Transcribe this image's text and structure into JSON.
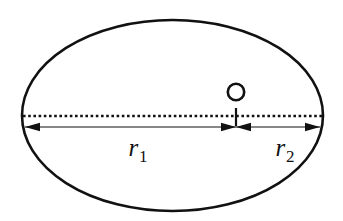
{
  "figure": {
    "name": "ellipse-radii-diagram",
    "background_color": "#ffffff",
    "stroke_color": "#111111",
    "canvas": {
      "width": 343,
      "height": 221
    }
  },
  "ellipse": {
    "center_x": 172.5,
    "center_y": 115.5,
    "radius_x": 150.5,
    "radius_y": 95.5,
    "stroke_width": 2.6,
    "fill": "none"
  },
  "axis_line": {
    "name": "major-axis-dotted",
    "y": 116,
    "x_start": 23,
    "x_end": 322,
    "style": "dotted",
    "dash_pattern": "2.6 2.6",
    "stroke_width": 2.4
  },
  "divider_tick": {
    "name": "center-tick",
    "x": 236,
    "y_top": 108,
    "y_bottom": 126,
    "stroke_width": 2.2
  },
  "circle_marker": {
    "name": "point-o-marker",
    "center_x": 236,
    "center_y": 92,
    "radius": 8.2,
    "stroke_width": 2.6,
    "fill": "none"
  },
  "dimension_line": {
    "y": 127,
    "x_left": 25,
    "x_split": 236,
    "x_right": 320,
    "stroke_width": 1.1,
    "arrow_length": 15,
    "arrow_half_height": 4.2
  },
  "segments": [
    {
      "name": "radius-1",
      "label": "r",
      "subscript": "1",
      "label_x": 138,
      "label_y": 156,
      "font_size": 25,
      "x_from": 25,
      "x_to": 236,
      "arrow_start": "left",
      "arrow_end": "right"
    },
    {
      "name": "radius-2",
      "label": "r",
      "subscript": "2",
      "label_x": 285,
      "label_y": 156,
      "font_size": 25,
      "x_from": 236,
      "x_to": 320,
      "arrow_start": "left",
      "arrow_end": "right"
    }
  ]
}
